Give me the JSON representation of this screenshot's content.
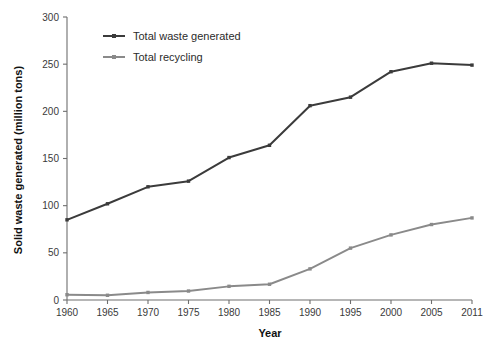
{
  "chart_data": {
    "type": "line",
    "title": "",
    "xlabel": "Year",
    "ylabel": "Solid waste generated (million tons)",
    "x": [
      1960,
      1965,
      1970,
      1975,
      1980,
      1985,
      1990,
      1995,
      2000,
      2005,
      2011
    ],
    "categories": [
      "1960",
      "1965",
      "1970",
      "1975",
      "1980",
      "1985",
      "1990",
      "1995",
      "2000",
      "2005",
      "2011"
    ],
    "series": [
      {
        "name": "Total waste generated",
        "color": "#3b3b3b",
        "values": [
          85,
          102,
          120,
          126,
          151,
          164,
          206,
          215,
          242,
          251,
          249
        ]
      },
      {
        "name": "Total recycling",
        "color": "#8a8a8a",
        "values": [
          5.6,
          5.0,
          8.0,
          9.5,
          14.5,
          16.7,
          33,
          55,
          69,
          80,
          87
        ]
      }
    ],
    "ylim": [
      0,
      300
    ],
    "yticks": [
      0,
      50,
      100,
      150,
      200,
      250,
      300
    ],
    "ytick_labels": [
      "0",
      "50",
      "100",
      "150",
      "200",
      "250",
      "300"
    ],
    "grid": false,
    "legend_position": "top-left-inside",
    "legend": [
      {
        "label": "Total waste generated",
        "color": "#3b3b3b"
      },
      {
        "label": "Total recycling",
        "color": "#8a8a8a"
      }
    ]
  },
  "axis": {
    "x_title": "Year",
    "y_title": "Solid waste generated (million tons)"
  }
}
